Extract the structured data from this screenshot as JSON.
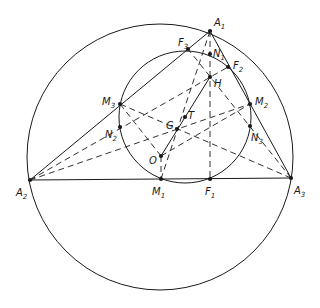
{
  "diagram": {
    "colors": {
      "stroke": "#1a1a1a",
      "background": "#ffffff"
    },
    "points": {
      "A1": {
        "x": 210,
        "y": 31,
        "label": "A",
        "sub": "1",
        "lx": 214,
        "ly": 26
      },
      "A2": {
        "x": 30,
        "y": 180,
        "label": "A",
        "sub": "2",
        "lx": 16,
        "ly": 196
      },
      "A3": {
        "x": 291,
        "y": 178,
        "label": "A",
        "sub": "3",
        "lx": 294,
        "ly": 194
      },
      "M1": {
        "x": 161,
        "y": 179,
        "label": "M",
        "sub": "1",
        "lx": 152,
        "ly": 195
      },
      "M2": {
        "x": 250,
        "y": 104,
        "label": "M",
        "sub": "2",
        "lx": 255,
        "ly": 105
      },
      "M3": {
        "x": 120,
        "y": 104,
        "label": "M",
        "sub": "3",
        "lx": 102,
        "ly": 105
      },
      "F1": {
        "x": 210,
        "y": 179,
        "label": "F",
        "sub": "1",
        "lx": 205,
        "ly": 195
      },
      "F2": {
        "x": 228,
        "y": 67,
        "label": "F",
        "sub": "2",
        "lx": 233,
        "ly": 69
      },
      "F3": {
        "x": 188,
        "y": 49,
        "label": "F",
        "sub": "3",
        "lx": 178,
        "ly": 46
      },
      "N1": {
        "x": 210,
        "y": 54,
        "label": "N",
        "sub": "1",
        "lx": 213,
        "ly": 57
      },
      "N2": {
        "x": 120,
        "y": 127,
        "label": "N",
        "sub": "2",
        "lx": 105,
        "ly": 138
      },
      "N3": {
        "x": 250,
        "y": 126,
        "label": "N",
        "sub": "3",
        "lx": 251,
        "ly": 141
      },
      "H": {
        "x": 210,
        "y": 77,
        "label": "H",
        "sub": "",
        "lx": 214,
        "ly": 87
      },
      "G": {
        "x": 177,
        "y": 129,
        "label": "G",
        "sub": "",
        "lx": 166,
        "ly": 129
      },
      "T": {
        "x": 185,
        "y": 117,
        "label": "T",
        "sub": "",
        "lx": 188,
        "ly": 119
      },
      "O": {
        "x": 161,
        "y": 156,
        "label": "O",
        "sub": "",
        "lx": 149,
        "ly": 164
      }
    },
    "circles": [
      {
        "name": "circumcircle",
        "cx": 160,
        "cy": 157,
        "r": 133
      },
      {
        "name": "nine-point-circle",
        "cx": 185,
        "cy": 117,
        "r": 66
      }
    ],
    "solid_lines": [
      [
        "A1",
        "A2"
      ],
      [
        "A1",
        "A3"
      ],
      [
        "A2",
        "A3"
      ],
      [
        "O",
        "H"
      ]
    ],
    "dashed_lines": [
      [
        "A1",
        "M1"
      ],
      [
        "A1",
        "F1"
      ],
      [
        "A2",
        "M2"
      ],
      [
        "A2",
        "F2"
      ],
      [
        "A3",
        "M3"
      ],
      [
        "A3",
        "F3"
      ],
      [
        "O",
        "M1"
      ],
      [
        "O",
        "M3"
      ],
      [
        "O",
        "M2"
      ]
    ]
  }
}
